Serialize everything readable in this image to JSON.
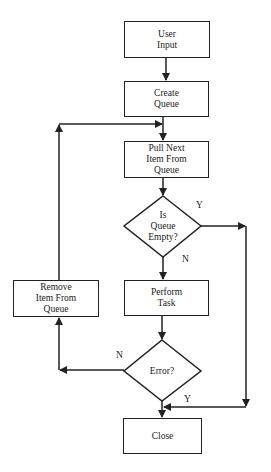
{
  "diagram": {
    "type": "flowchart",
    "nodes": {
      "user_input": {
        "label": "User\nInput",
        "shape": "process"
      },
      "create_queue": {
        "label": "Create\nQueue",
        "shape": "process"
      },
      "pull_next": {
        "label": "Pull Next\nItem From\nQueue",
        "shape": "process"
      },
      "is_queue_empty": {
        "label": "Is\nQueue\nEmpty?",
        "shape": "decision"
      },
      "perform_task": {
        "label": "Perform\nTask",
        "shape": "process"
      },
      "error": {
        "label": "Error?",
        "shape": "decision"
      },
      "remove_item": {
        "label": "Remove\nItem From\nQueue",
        "shape": "process"
      },
      "close": {
        "label": "Close",
        "shape": "process"
      }
    },
    "edges": [
      {
        "from": "user_input",
        "to": "create_queue",
        "label": ""
      },
      {
        "from": "create_queue",
        "to": "pull_next",
        "label": ""
      },
      {
        "from": "pull_next",
        "to": "is_queue_empty",
        "label": ""
      },
      {
        "from": "is_queue_empty",
        "to": "close",
        "label": "Y"
      },
      {
        "from": "is_queue_empty",
        "to": "perform_task",
        "label": "N"
      },
      {
        "from": "perform_task",
        "to": "error",
        "label": ""
      },
      {
        "from": "error",
        "to": "remove_item",
        "label": "N"
      },
      {
        "from": "error",
        "to": "close",
        "label": "Y"
      },
      {
        "from": "remove_item",
        "to": "pull_next",
        "label": ""
      }
    ],
    "edge_labels": {
      "empty_yes": "Y",
      "empty_no": "N",
      "error_no": "N",
      "error_yes": "Y"
    },
    "colors": {
      "stroke": "#222222",
      "fill": "#ffffff",
      "text": "#1a1a1a"
    }
  }
}
